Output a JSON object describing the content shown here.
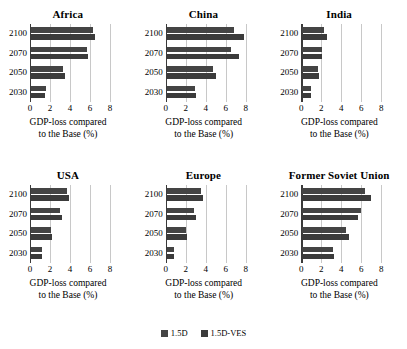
{
  "chart_data": {
    "type": "bar",
    "orientation": "horizontal",
    "title": "",
    "xlabel": "GDP-loss compared to the Base (%)",
    "xlabel_line1": "GDP-loss compared",
    "xlabel_line2": "to the Base (%)",
    "ylabel": "",
    "categories": [
      "2100",
      "2070",
      "2050",
      "2030"
    ],
    "xlim": [
      0,
      8
    ],
    "xticks": [
      0,
      2,
      4,
      6,
      8
    ],
    "xtick_labels": [
      "0",
      "2",
      "4",
      "6",
      "8"
    ],
    "grid": true,
    "grid_axis": "x",
    "legend_position": "bottom-center",
    "series_names": [
      "1.5D",
      "1.5D-VES"
    ],
    "series_colors": [
      "#444444",
      "#3b3b3b"
    ],
    "panels": [
      {
        "title": "Africa",
        "categories": [
          "2100",
          "2070",
          "2050",
          "2030"
        ],
        "series": [
          {
            "name": "1.5D",
            "values": [
              6.2,
              5.6,
              3.2,
              1.5
            ]
          },
          {
            "name": "1.5D-VES",
            "values": [
              6.4,
              5.7,
              3.4,
              1.4
            ]
          }
        ]
      },
      {
        "title": "China",
        "categories": [
          "2100",
          "2070",
          "2050",
          "2030"
        ],
        "series": [
          {
            "name": "1.5D",
            "values": [
              6.7,
              6.4,
              4.6,
              2.8
            ]
          },
          {
            "name": "1.5D-VES",
            "values": [
              7.7,
              7.2,
              4.9,
              2.9
            ]
          }
        ]
      },
      {
        "title": "India",
        "categories": [
          "2100",
          "2070",
          "2050",
          "2030"
        ],
        "series": [
          {
            "name": "1.5D",
            "values": [
              2.2,
              2.0,
              1.6,
              0.9
            ]
          },
          {
            "name": "1.5D-VES",
            "values": [
              2.5,
              2.0,
              1.7,
              0.9
            ]
          }
        ]
      },
      {
        "title": "USA",
        "categories": [
          "2100",
          "2070",
          "2050",
          "2030"
        ],
        "series": [
          {
            "name": "1.5D",
            "values": [
              3.6,
              2.9,
              2.0,
              1.1
            ]
          },
          {
            "name": "1.5D-VES",
            "values": [
              3.8,
              3.1,
              2.1,
              1.1
            ]
          }
        ]
      },
      {
        "title": "Europe",
        "categories": [
          "2100",
          "2070",
          "2050",
          "2030"
        ],
        "series": [
          {
            "name": "1.5D",
            "values": [
              3.4,
              2.7,
              1.9,
              0.7
            ]
          },
          {
            "name": "1.5D-VES",
            "values": [
              3.6,
              2.9,
              2.0,
              0.7
            ]
          }
        ]
      },
      {
        "title": "Former Soviet Union",
        "categories": [
          "2100",
          "2070",
          "2050",
          "2030"
        ],
        "series": [
          {
            "name": "1.5D",
            "values": [
              6.3,
              5.9,
              4.4,
              3.1
            ]
          },
          {
            "name": "1.5D-VES",
            "values": [
              6.9,
              5.6,
              4.7,
              3.2
            ]
          }
        ]
      }
    ]
  },
  "legend": {
    "items": [
      {
        "label": "1.5D",
        "color": "#444444"
      },
      {
        "label": "1.5D-VES",
        "color": "#3b3b3b"
      }
    ]
  }
}
